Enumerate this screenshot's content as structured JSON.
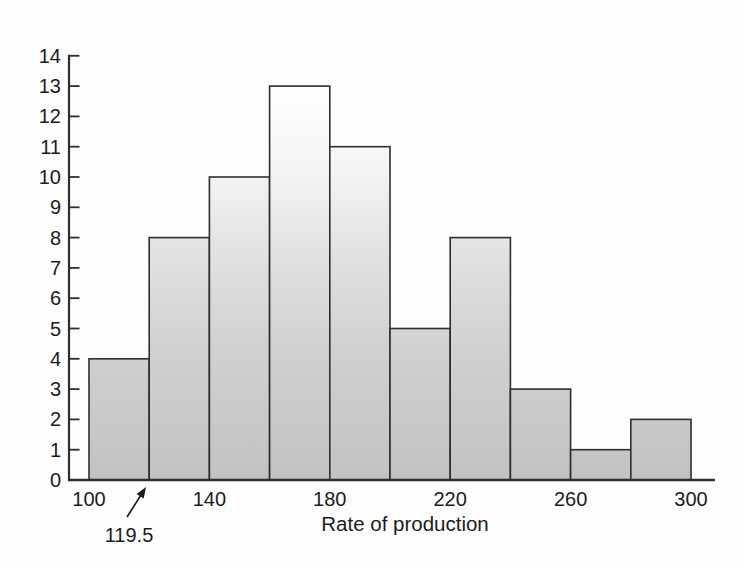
{
  "figure": {
    "background_color": "#fdfdfd",
    "axis_color": "#2e2e2e",
    "text_color": "#1c1c1c"
  },
  "chart_data": {
    "type": "bar",
    "subtype": "histogram",
    "xlabel": "Rate of production",
    "ylabel": "",
    "bin_edges": [
      100,
      120,
      140,
      160,
      180,
      200,
      220,
      240,
      260,
      280,
      300
    ],
    "counts": [
      4,
      8,
      10,
      13,
      11,
      5,
      8,
      3,
      1,
      2
    ],
    "x_tick_values": [
      100,
      140,
      180,
      220,
      260,
      300
    ],
    "x_tick_labels": [
      "100",
      "140",
      "180",
      "220",
      "260",
      "300"
    ],
    "y_ticks": [
      0,
      1,
      2,
      3,
      4,
      5,
      6,
      7,
      8,
      9,
      10,
      11,
      12,
      13,
      14
    ],
    "xlim": [
      100,
      300
    ],
    "ylim": [
      0,
      14
    ],
    "grid": false,
    "bar_border_color": "#2e2e2e",
    "bar_gradient_bottom_color": "#c0c3c2",
    "bar_gradient_top_color": "#ffffff",
    "annotation": {
      "text": "119.5",
      "points_to_x": 119.5
    }
  }
}
